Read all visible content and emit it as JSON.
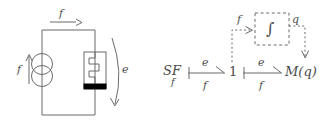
{
  "figure": {
    "stroke_color": "#6b6b6b",
    "text_color": "#4a4a4a",
    "fill_black": "#000000",
    "background": "#ffffff"
  },
  "circuit": {
    "name": "schematic",
    "top_flow_label": "f",
    "source_flow_label": "f",
    "effort_label": "e",
    "source": {
      "name": "flow-source",
      "symbol": "two-overlapping-circles"
    },
    "element": {
      "name": "variable-capacitor",
      "symbol": "zigzag-plunger"
    }
  },
  "bondgraph": {
    "name": "bond-graph",
    "source_element": {
      "label": "SF",
      "subscript": "f"
    },
    "junction": {
      "label": "1"
    },
    "modulated_element": {
      "label": "M(q)"
    },
    "integrator": {
      "label": "∫",
      "input_label": "f",
      "output_label": "q"
    },
    "bonds": [
      {
        "name": "bond-sf-to-1",
        "effort": "e",
        "flow": "f"
      },
      {
        "name": "bond-1-to-mq",
        "effort": "e",
        "flow": "f"
      }
    ]
  }
}
